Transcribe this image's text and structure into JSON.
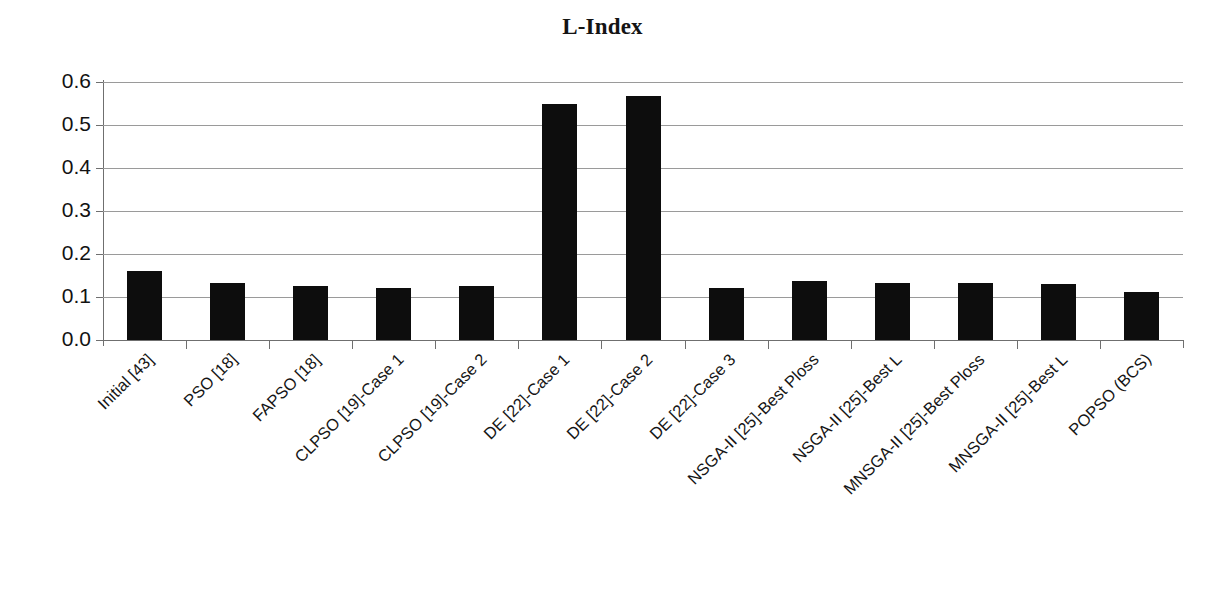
{
  "chart_data": {
    "type": "bar",
    "title": "L-Index",
    "xlabel": "",
    "ylabel": "",
    "ylim": [
      0.0,
      0.6
    ],
    "ytick_labels": [
      "0.6",
      "0.5",
      "0.4",
      "0.3",
      "0.2",
      "0.1",
      "0.0"
    ],
    "ytick_values": [
      0.6,
      0.5,
      0.4,
      0.3,
      0.2,
      0.1,
      0.0
    ],
    "grid": true,
    "legend": "none",
    "bar_color": "#0d0d0d",
    "categories": [
      "Initial [43]",
      "PSO [18]",
      "FAPSO [18]",
      "CLPSO [19]-Case 1",
      "CLPSO [19]-Case 2",
      "DE [22]-Case 1",
      "DE [22]-Case 2",
      "DE [22]-Case 3",
      "NSGA-II [25]-Best Ploss",
      "NSGA-II [25]-Best L",
      "MNSGA-II [25]-Best Ploss",
      "MNSGA-II [25]-Best L",
      "POPSO (BCS)"
    ],
    "values": [
      0.16,
      0.133,
      0.125,
      0.122,
      0.125,
      0.548,
      0.568,
      0.121,
      0.137,
      0.133,
      0.133,
      0.131,
      0.111
    ]
  }
}
